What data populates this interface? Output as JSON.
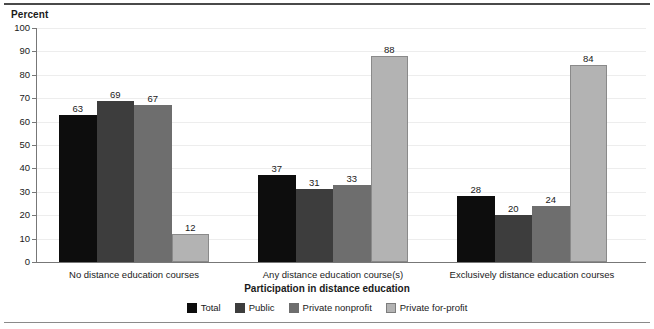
{
  "chart_data": {
    "type": "bar",
    "title": "",
    "ylabel": "Percent",
    "xlabel": "Participation in distance education",
    "ylim": [
      0,
      100
    ],
    "yticks": [
      0,
      10,
      20,
      30,
      40,
      50,
      60,
      70,
      80,
      90,
      100
    ],
    "grid": true,
    "legend_position": "bottom",
    "categories": [
      "No distance education courses",
      "Any distance education course(s)",
      "Exclusively distance education courses"
    ],
    "series": [
      {
        "name": "Total",
        "color": "#0d0d0d",
        "values": [
          63,
          37,
          28
        ]
      },
      {
        "name": "Public",
        "color": "#3d3d3d",
        "values": [
          69,
          31,
          20
        ]
      },
      {
        "name": "Private nonprofit",
        "color": "#6e6e6e",
        "values": [
          67,
          33,
          24
        ]
      },
      {
        "name": "Private for-profit",
        "color": "#b3b3b3",
        "values": [
          12,
          88,
          84
        ]
      }
    ]
  }
}
